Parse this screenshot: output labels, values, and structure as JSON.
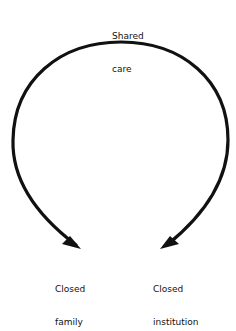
{
  "diagram": {
    "nodes": {
      "top": {
        "line1": "Shared",
        "line2": "care"
      },
      "left": {
        "line1": "Closed",
        "line2": "family"
      },
      "right": {
        "line1": "Closed",
        "line2": "institution"
      }
    },
    "edges": [
      {
        "from": "Shared care",
        "to": "Closed family"
      },
      {
        "from": "Shared care",
        "to": "Closed institution"
      }
    ],
    "colors": {
      "stroke": "#111111",
      "text": "#111111",
      "background": "#ffffff"
    }
  }
}
